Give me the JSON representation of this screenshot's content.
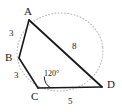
{
  "figure": {
    "type": "cyclic-quadrilateral",
    "stroke_color": "#1a1a1a",
    "circle_color": "#b4b4b4",
    "background": "#ffffff",
    "canvas": {
      "width": 122,
      "height": 112
    },
    "vertices": [
      {
        "id": "A",
        "label": "A",
        "x": 29,
        "y": 20,
        "label_x": 24,
        "label_y": 6
      },
      {
        "id": "B",
        "label": "B",
        "x": 19,
        "y": 58,
        "label_x": 5,
        "label_y": 52
      },
      {
        "id": "C",
        "label": "C",
        "x": 38,
        "y": 88,
        "label_x": 31,
        "label_y": 91
      },
      {
        "id": "D",
        "label": "D",
        "x": 102,
        "y": 87,
        "label_x": 107,
        "label_y": 79
      }
    ],
    "edges": [
      {
        "id": "AB",
        "from": "A",
        "to": "B",
        "length": "3",
        "label_x": 9,
        "label_y": 29
      },
      {
        "id": "BC",
        "from": "B",
        "to": "C",
        "length": "3",
        "label_x": 14,
        "label_y": 71
      },
      {
        "id": "CD",
        "from": "C",
        "to": "D",
        "length": "5",
        "label_x": 68,
        "label_y": 97
      },
      {
        "id": "AD",
        "from": "A",
        "to": "D",
        "length": "8",
        "label_x": 72,
        "label_y": 42
      }
    ],
    "angles": [
      {
        "id": "angle-C",
        "vertex": "C",
        "value": "120°",
        "label_x": 44,
        "label_y": 70
      }
    ],
    "circumcircle": {
      "cx": 60,
      "cy": 52,
      "r": 43
    }
  }
}
